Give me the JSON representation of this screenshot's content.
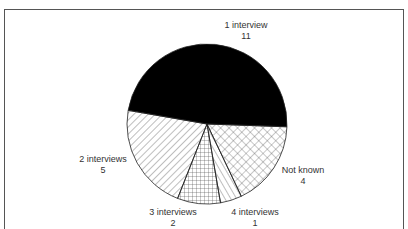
{
  "chart_data": {
    "type": "pie",
    "title": "",
    "categories": [
      "1 interview",
      "2 interviews",
      "3 interviews",
      "4 interviews",
      "Not known"
    ],
    "values": [
      11,
      5,
      2,
      1,
      4
    ],
    "total": 23,
    "fills": [
      "solid black",
      "diagonal hatch",
      "grid crosshatch",
      "diagonal hatch (reverse)",
      "diamond crosshatch"
    ]
  },
  "labels": [
    {
      "name": "1 interview",
      "value": "11"
    },
    {
      "name": "2 interviews",
      "value": "5"
    },
    {
      "name": "3 interviews",
      "value": "2"
    },
    {
      "name": "4 interviews",
      "value": "1"
    },
    {
      "name": "Not known",
      "value": "4"
    }
  ]
}
